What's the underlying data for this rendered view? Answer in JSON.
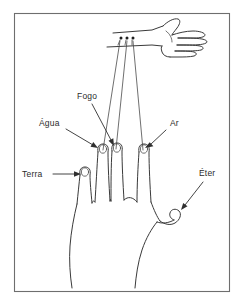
{
  "figure": {
    "language": "pt-BR",
    "background_color": "#ffffff",
    "frame_color": "#6e6e6e",
    "ink_color": "#3a3a3a",
    "label_color": "#2b2b2b"
  },
  "labels": {
    "terra": "Terra",
    "agua": "Água",
    "fogo": "Fogo",
    "ar": "Ar",
    "eter": "Éter"
  },
  "annotations": [
    {
      "id": "terra",
      "text": "Terra",
      "target": "index-finger",
      "label_x": 22,
      "label_y": 177,
      "arrow_from_x": 53,
      "arrow_from_y": 174,
      "arrow_to_x": 80,
      "arrow_to_y": 174
    },
    {
      "id": "agua",
      "text": "Água",
      "target": "middle-finger",
      "label_x": 39,
      "label_y": 126,
      "arrow_from_x": 66,
      "arrow_from_y": 129,
      "arrow_to_x": 98,
      "arrow_to_y": 148
    },
    {
      "id": "fogo",
      "text": "Fogo",
      "target": "ring-finger",
      "label_x": 77,
      "label_y": 99,
      "arrow_from_x": 92,
      "arrow_from_y": 104,
      "arrow_to_x": 114,
      "arrow_to_y": 146
    },
    {
      "id": "ar",
      "text": "Ar",
      "target": "little-finger",
      "label_x": 170,
      "label_y": 126,
      "arrow_from_x": 166,
      "arrow_from_y": 130,
      "arrow_to_x": 145,
      "arrow_to_y": 148
    },
    {
      "id": "eter",
      "text": "Éter",
      "target": "thumb",
      "label_x": 199,
      "label_y": 176,
      "arrow_from_x": 203,
      "arrow_from_y": 182,
      "arrow_to_x": 181,
      "arrow_to_y": 210
    }
  ],
  "elements": {
    "main_hand": "open left hand, palm toward viewer, four fingers up and thumb to the right",
    "upper_hand": "small forearm and open hand sketch at top right",
    "connector_lines": "three long straight lines from the wrist of the upper hand down to the fingertips of the main hand",
    "wrist_markers": "three small dots on the upper forearm"
  }
}
